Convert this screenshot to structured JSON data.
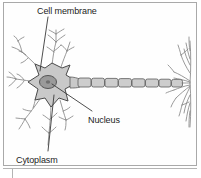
{
  "figure": {
    "panel_background": "#fefefe",
    "panel_border_color": "#a9a9a9"
  },
  "labels": {
    "cell_membrane": "Cell membrane",
    "nucleus": "Nucleus",
    "cytoplasm": "Cytoplasm"
  },
  "caption": {
    "figure_number": "",
    "text": ""
  },
  "colors": {
    "soma_fill": "#c9c9c9",
    "soma_stroke": "#4a4a4a",
    "nucleus_fill": "#9a9a9a",
    "nucleus_stroke": "#4a4a4a",
    "myelin_fill": "#cdcdcd",
    "myelin_stroke": "#5a5a5a",
    "dendrite_stroke": "#808080",
    "leader_stroke": "#3a3a3a",
    "label_text": "#1c1c1c"
  },
  "structures": {
    "soma": "star-shaped cell body",
    "nucleus": "oval nucleus inside soma",
    "dendrites": "branching processes radiating from soma",
    "axon": "long process extending to the right",
    "myelin_segments": 9,
    "axon_terminals": "branching terminal arbor at right end"
  }
}
